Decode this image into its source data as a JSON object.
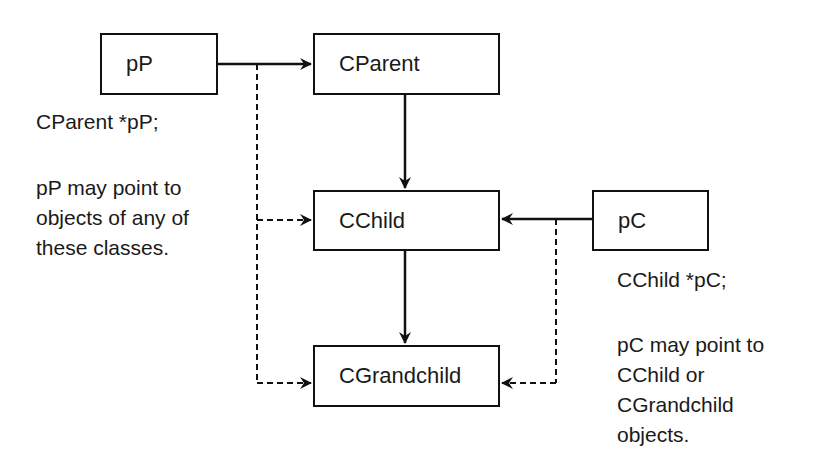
{
  "diagram": {
    "nodes": {
      "pP": {
        "label": "pP"
      },
      "cparent": {
        "label": "CParent"
      },
      "cchild": {
        "label": "CChild"
      },
      "cgrandchild": {
        "label": "CGrandchild"
      },
      "pC": {
        "label": "pC"
      }
    },
    "annotations": {
      "pp_declaration": "CParent *pP;",
      "pp_note": [
        "pP may point to",
        "objects of any of",
        "these classes."
      ],
      "pc_declaration": "CChild *pC;",
      "pc_note": [
        "pC may point to",
        "CChild or",
        "CGrandchild",
        "objects."
      ]
    },
    "edges": [
      {
        "from": "pP",
        "to": "CParent",
        "style": "solid"
      },
      {
        "from": "pP",
        "to": "CChild",
        "style": "dashed"
      },
      {
        "from": "pP",
        "to": "CGrandchild",
        "style": "dashed"
      },
      {
        "from": "CParent",
        "to": "CChild",
        "style": "solid"
      },
      {
        "from": "CChild",
        "to": "CGrandchild",
        "style": "solid"
      },
      {
        "from": "pC",
        "to": "CChild",
        "style": "solid"
      },
      {
        "from": "pC",
        "to": "CGrandchild",
        "style": "dashed"
      }
    ],
    "colors": {
      "stroke": "#111111",
      "background": "#ffffff"
    }
  }
}
